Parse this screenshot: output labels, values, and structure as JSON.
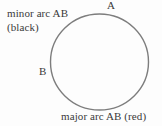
{
  "figure": {
    "background_color": "#fdfdfd",
    "text_color": "#3a3a3a"
  },
  "shape": {
    "name": "circle",
    "stroke_color": "#7d7d7d",
    "fill": "none",
    "center_x": 99.5,
    "center_y": 62,
    "radius_x": 49,
    "radius_y": 48,
    "stroke_width": 1.4
  },
  "labels": {
    "minor_arc": "minor arc AB",
    "minor_arc_color_note": "(black)",
    "point_a": "A",
    "point_b": "B",
    "major_arc": "major arc AB (red)"
  },
  "points": [
    {
      "name": "A",
      "x": 112,
      "y": 14
    },
    {
      "name": "B",
      "x": 52,
      "y": 76
    }
  ]
}
